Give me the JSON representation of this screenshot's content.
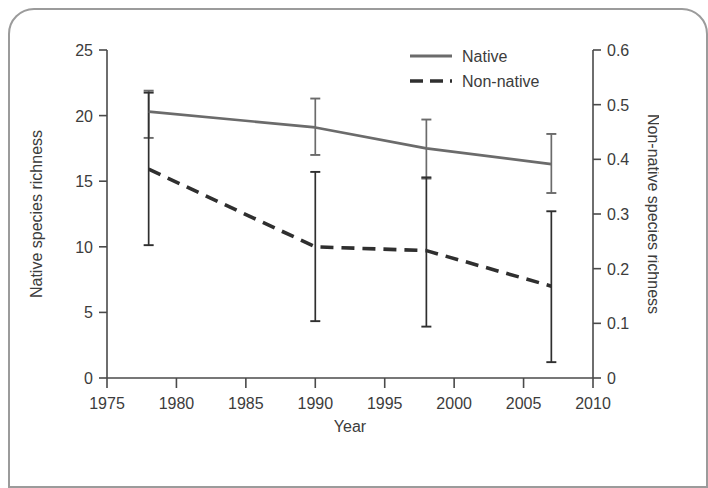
{
  "chart_data": {
    "type": "line",
    "title": "",
    "xlabel": "Year",
    "ylabel": "Native species richness",
    "y2label": "Non-native species richness",
    "xlim": [
      1975,
      2010
    ],
    "ylim": [
      0,
      25
    ],
    "y2lim": [
      0,
      0.6
    ],
    "grid": false,
    "legend_position": "top-right",
    "x": [
      1978,
      1990,
      1998,
      2007
    ],
    "xticks": [
      "1975",
      "1980",
      "1985",
      "1990",
      "1995",
      "2000",
      "2005",
      "2010"
    ],
    "xtick_values": [
      1975,
      1980,
      1985,
      1990,
      1995,
      2000,
      2005,
      2010
    ],
    "yticks": [
      "0",
      "5",
      "10",
      "15",
      "20",
      "25"
    ],
    "ytick_values": [
      0,
      5,
      10,
      15,
      20,
      25
    ],
    "y2ticks": [
      "0",
      "0.1",
      "0.2",
      "0.3",
      "0.4",
      "0.5",
      "0.6"
    ],
    "y2tick_values": [
      0,
      0.1,
      0.2,
      0.3,
      0.4,
      0.5,
      0.6
    ],
    "series": [
      {
        "name": "Native",
        "axis": "left",
        "style": "solid",
        "color": "#6b6b6b",
        "values": [
          20.3,
          19.1,
          17.5,
          16.3
        ],
        "err_low": [
          18.3,
          17.0,
          15.2,
          14.1
        ],
        "err_high": [
          21.9,
          21.3,
          19.7,
          18.6
        ]
      },
      {
        "name": "Non-native",
        "axis": "right",
        "style": "dashed",
        "color": "#2f2f2f",
        "values": [
          0.382,
          0.24,
          0.233,
          0.168
        ],
        "err_low": [
          0.243,
          0.104,
          0.094,
          0.029
        ],
        "err_high": [
          0.522,
          0.377,
          0.367,
          0.305
        ]
      }
    ]
  },
  "legend": {
    "entries": [
      {
        "label": "Native"
      },
      {
        "label": "Non-native"
      }
    ]
  },
  "axes": {
    "x_title": "Year",
    "y_left_title": "Native species richness",
    "y_right_title": "Non-native species richness"
  }
}
